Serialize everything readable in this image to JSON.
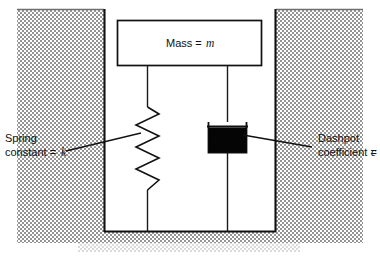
{
  "figure": {
    "background_color": "#ffffff",
    "line_color": "#111111",
    "hatch_color": "#8a8a8a",
    "damper_fill_color": "#050505"
  },
  "labels": {
    "mass": {
      "text": "Mass = ",
      "symbol": "m",
      "name": "Mass",
      "equals": "="
    },
    "spring": {
      "line1": "Spring",
      "line2": "constant = ",
      "symbol": "k",
      "name": "Spring constant",
      "equals": "="
    },
    "dashpot": {
      "line1": "Dashpot",
      "line2": "coefficient = ",
      "symbol": "c",
      "name": "Dashpot coefficient",
      "equals": "="
    }
  },
  "components": [
    {
      "id": "mass-block",
      "label": "Mass = m"
    },
    {
      "id": "spring",
      "label": "Spring constant = k"
    },
    {
      "id": "dashpot",
      "label": "Dashpot coefficient = c"
    },
    {
      "id": "ground-pit",
      "label": "Hatched ground / pit walls"
    }
  ]
}
